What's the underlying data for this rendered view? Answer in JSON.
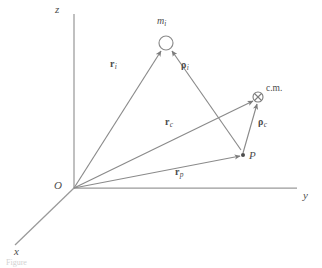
{
  "figure": {
    "type": "vector-diagram",
    "background_color": "#ffffff",
    "line_color": "#8a8a8a",
    "text_color": "#4d4d4d"
  },
  "axes": [
    {
      "id": "z",
      "label": "z",
      "label_x": 55,
      "label_y": 4,
      "from": [
        74,
        188
      ],
      "to": [
        74,
        14
      ]
    },
    {
      "id": "y",
      "label": "y",
      "label_x": 303,
      "label_y": 190,
      "from": [
        74,
        188
      ],
      "to": [
        297,
        188
      ]
    },
    {
      "id": "x",
      "label": "x",
      "label_x": 14,
      "label_y": 246,
      "from": [
        74,
        188
      ],
      "to": [
        15,
        245
      ]
    }
  ],
  "origin": {
    "label": "O",
    "label_x": 54,
    "label_y": 180,
    "x": 74,
    "y": 188
  },
  "points": [
    {
      "id": "mass-element",
      "label": "m",
      "subscript": "i",
      "marker": "open-circle",
      "x": 166,
      "y": 43,
      "radius": 7,
      "label_x": 157,
      "label_y": 16
    },
    {
      "id": "point-p",
      "label": "P",
      "marker": "filled-dot",
      "x": 243,
      "y": 155,
      "radius": 2,
      "label_x": 249,
      "label_y": 150
    },
    {
      "id": "center-of-mass",
      "label": "c.m.",
      "marker": "circle-cross",
      "x": 258,
      "y": 97,
      "radius": 5,
      "label_x": 266,
      "label_y": 84
    }
  ],
  "vectors": [
    {
      "id": "r-i",
      "symbol": "r",
      "subscript": "i",
      "symbol_style": "bold-roman",
      "from": [
        74,
        188
      ],
      "to": [
        161,
        51
      ],
      "label_x": 110,
      "label_y": 59,
      "description": "position vector from origin O to mass element m_i"
    },
    {
      "id": "rho-i",
      "symbol": "ρ",
      "subscript": "i",
      "symbol_style": "bold-greek",
      "from": [
        241,
        150
      ],
      "to": [
        172,
        51
      ],
      "label_x": 181,
      "label_y": 60,
      "description": "position vector from point P to mass element m_i"
    },
    {
      "id": "r-c",
      "symbol": "r",
      "subscript": "c",
      "symbol_style": "bold-roman",
      "from": [
        74,
        188
      ],
      "to": [
        253,
        101
      ],
      "label_x": 165,
      "label_y": 117,
      "description": "position vector from origin O to the center of mass"
    },
    {
      "id": "rho-c",
      "symbol": "ρ",
      "subscript": "c",
      "symbol_style": "bold-greek",
      "from": [
        243,
        153
      ],
      "to": [
        257,
        104
      ],
      "label_x": 258,
      "label_y": 117,
      "description": "position vector from point P to the center of mass"
    },
    {
      "id": "r-p",
      "symbol": "r",
      "subscript": "p",
      "symbol_style": "bold-roman",
      "from": [
        74,
        188
      ],
      "to": [
        240,
        156
      ],
      "label_x": 175,
      "label_y": 167,
      "description": "position vector from origin O to point P"
    }
  ],
  "caption": {
    "text": "Figure"
  }
}
